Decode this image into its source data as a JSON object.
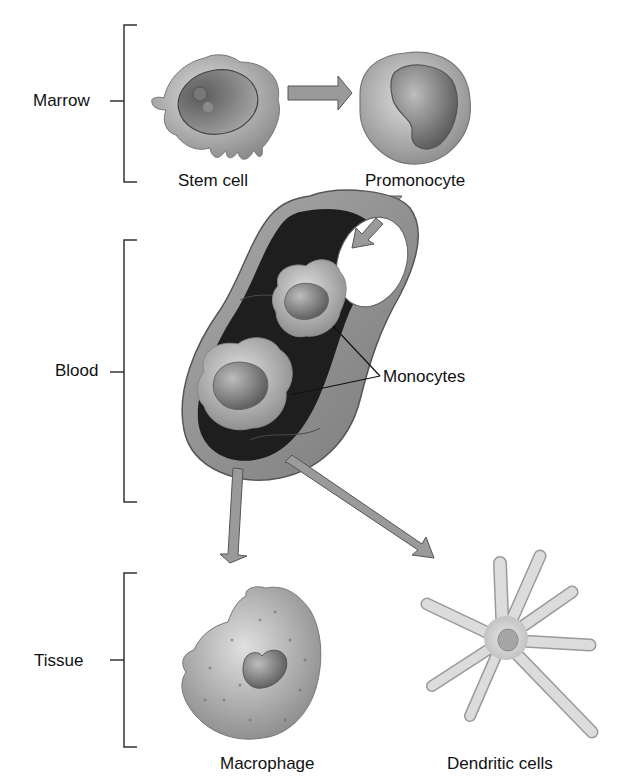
{
  "stages": {
    "marrow": "Marrow",
    "blood": "Blood",
    "tissue": "Tissue"
  },
  "cells": {
    "stem_cell": "Stem cell",
    "promonocyte": "Promonocyte",
    "monocytes": "Monocytes",
    "macrophage": "Macrophage",
    "dendritic": "Dendritic cells"
  },
  "colors": {
    "arrow_fill": "#9a9a9a",
    "arrow_stroke": "#555555",
    "cell_fill": "#b4b4b4",
    "vessel_dark": "#222222"
  }
}
